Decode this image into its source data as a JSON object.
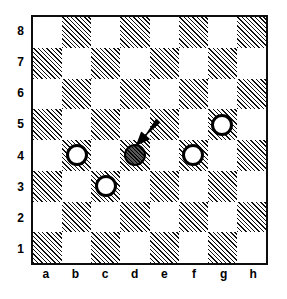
{
  "diagram": {
    "type": "checkerboard",
    "board": {
      "files": [
        "a",
        "b",
        "c",
        "d",
        "e",
        "f",
        "g",
        "h"
      ],
      "ranks": [
        "8",
        "7",
        "6",
        "5",
        "4",
        "3",
        "2",
        "1"
      ],
      "size": 8,
      "light_square_color": "#ffffff",
      "dark_square_color": "#111111",
      "dark_square_fill": "diagonal-hatch",
      "border_color": "#0d0d0d",
      "top_left_square_shade": "light"
    },
    "pieces": [
      {
        "square": "b4",
        "file": "b",
        "rank": "4",
        "color": "white",
        "shape": "hollow-circle",
        "outline": "#000000",
        "fill": "#ffffff"
      },
      {
        "square": "c3",
        "file": "c",
        "rank": "3",
        "color": "white",
        "shape": "hollow-circle",
        "outline": "#000000",
        "fill": "#ffffff"
      },
      {
        "square": "d4",
        "file": "d",
        "rank": "4",
        "color": "dark",
        "shape": "filled-circle",
        "outline": "#000000",
        "fill": "#2e2e2e"
      },
      {
        "square": "f4",
        "file": "f",
        "rank": "4",
        "color": "white",
        "shape": "hollow-circle",
        "outline": "#000000",
        "fill": "#ffffff"
      },
      {
        "square": "g5",
        "file": "g",
        "rank": "5",
        "color": "white",
        "shape": "hollow-circle",
        "outline": "#000000",
        "fill": "#ffffff"
      }
    ],
    "annotations": [
      {
        "kind": "arrow",
        "name": "pointer-arrow",
        "points_to": "d4",
        "direction": "down-left",
        "color": "#000000",
        "from_square": "e5"
      }
    ]
  },
  "chart_data": {
    "type": "table",
    "categories": [
      "a",
      "b",
      "c",
      "d",
      "e",
      "f",
      "g",
      "h"
    ],
    "rows": [
      "8",
      "7",
      "6",
      "5",
      "4",
      "3",
      "2",
      "1"
    ],
    "values": [
      [
        "",
        "",
        "",
        "",
        "",
        "",
        "",
        ""
      ],
      [
        "",
        "",
        "",
        "",
        "",
        "",
        "",
        ""
      ],
      [
        "",
        "",
        "",
        "",
        "",
        "",
        "",
        ""
      ],
      [
        "",
        "",
        "",
        "",
        "",
        "",
        "white",
        ""
      ],
      [
        "",
        "white",
        "",
        "dark",
        "",
        "white",
        "",
        ""
      ],
      [
        "",
        "",
        "white",
        "",
        "",
        "",
        "",
        ""
      ],
      [
        "",
        "",
        "",
        "",
        "",
        "",
        "",
        ""
      ],
      [
        "",
        "",
        "",
        "",
        "",
        "",
        "",
        ""
      ]
    ],
    "xlabel": "file",
    "ylabel": "rank",
    "grid": true,
    "legend": []
  }
}
